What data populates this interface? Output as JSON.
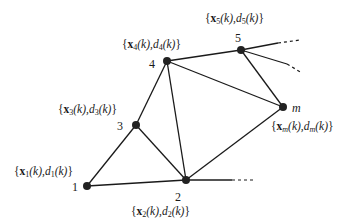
{
  "diagram": {
    "type": "network-graph",
    "nodes": [
      {
        "id": "1",
        "label": "1",
        "x": 87,
        "y": 186,
        "set": {
          "open": "{",
          "vec": "x",
          "sub": "1",
          "mid": "(k),",
          "d": "d",
          "dsub": "1",
          "close": "(k)}"
        }
      },
      {
        "id": "2",
        "label": "2",
        "x": 186,
        "y": 180,
        "set": {
          "open": "{",
          "vec": "x",
          "sub": "2",
          "mid": "(k),",
          "d": "d",
          "dsub": "2",
          "close": "(k)}"
        }
      },
      {
        "id": "3",
        "label": "3",
        "x": 136,
        "y": 125,
        "set": {
          "open": "{",
          "vec": "x",
          "sub": "3",
          "mid": "(k),",
          "d": "d",
          "dsub": "3",
          "close": "(k)}"
        }
      },
      {
        "id": "4",
        "label": "4",
        "x": 167,
        "y": 61,
        "set": {
          "open": "{",
          "vec": "x",
          "sub": "4",
          "mid": "(k),",
          "d": "d",
          "dsub": "4",
          "close": "(k)}"
        }
      },
      {
        "id": "5",
        "label": "5",
        "x": 241,
        "y": 50,
        "set": {
          "open": "{",
          "vec": "x",
          "sub": "5",
          "mid": "(k),",
          "d": "d",
          "dsub": "5",
          "close": "(k)}"
        }
      },
      {
        "id": "m",
        "label": "m",
        "x": 283,
        "y": 107,
        "set": {
          "open": "{",
          "vec": "x",
          "sub": "m",
          "mid": "(k),",
          "d": "d",
          "dsub": "m",
          "close": "(k)}"
        }
      }
    ],
    "edges": [
      [
        "1",
        "2"
      ],
      [
        "1",
        "3"
      ],
      [
        "3",
        "4"
      ],
      [
        "3",
        "2"
      ],
      [
        "4",
        "2"
      ],
      [
        "4",
        "5"
      ],
      [
        "4",
        "m"
      ],
      [
        "5",
        "m"
      ],
      [
        "2",
        "m"
      ]
    ],
    "open_edges": [
      {
        "from": "5",
        "solid_to": [
          278,
          43
        ],
        "dash_to": [
          300,
          40
        ]
      },
      {
        "from": "5",
        "solid_to": [
          287,
          64
        ],
        "dash_to": [
          302,
          73
        ]
      },
      {
        "from": "2",
        "solid_to": [
          232,
          180
        ],
        "dash_to": [
          253,
          180
        ]
      }
    ],
    "colors": {
      "line": "#1a1a1a",
      "node": "#222222",
      "background": "#ffffff"
    }
  }
}
